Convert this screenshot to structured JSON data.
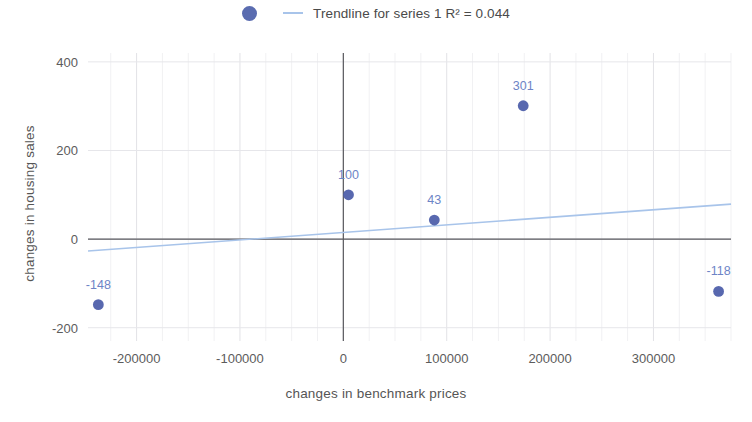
{
  "chart_data": {
    "type": "scatter",
    "title": "",
    "xlabel": "changes in benchmark prices",
    "ylabel": "changes in housing sales",
    "xlim": [
      -247000,
      375000
    ],
    "ylim": [
      -230,
      420
    ],
    "grid": true,
    "legend_position": "top-center",
    "legend": [
      {
        "label": "Trendline for series 1 R² = 0.044",
        "marker": "circle",
        "marker_color": "#5a6cb0",
        "line_color": "#a8c4ea"
      }
    ],
    "xticks": [
      -200000,
      -100000,
      0,
      100000,
      200000,
      300000
    ],
    "xtick_labels": [
      "-200000",
      "-100000",
      "0",
      "100000",
      "200000",
      "300000"
    ],
    "yticks": [
      -200,
      0,
      200,
      400
    ],
    "ytick_labels": [
      "-200",
      "0",
      "200",
      "400"
    ],
    "series": [
      {
        "name": "series 1",
        "color": "#4a5ba8",
        "points": [
          {
            "x": -237000,
            "y": -148,
            "label": "-148"
          },
          {
            "x": 5000,
            "y": 100,
            "label": "100"
          },
          {
            "x": 88000,
            "y": 43,
            "label": "43"
          },
          {
            "x": 174000,
            "y": 301,
            "label": "301"
          },
          {
            "x": 363000,
            "y": -118,
            "label": "-118"
          }
        ]
      }
    ],
    "trendline": {
      "r_squared": 0.044,
      "color": "#a8c4ea",
      "x_start": -247000,
      "y_start": -27,
      "x_end": 375000,
      "y_end": 79
    }
  },
  "axis_titles": {
    "x": "changes in benchmark prices",
    "y": "changes in housing sales"
  }
}
